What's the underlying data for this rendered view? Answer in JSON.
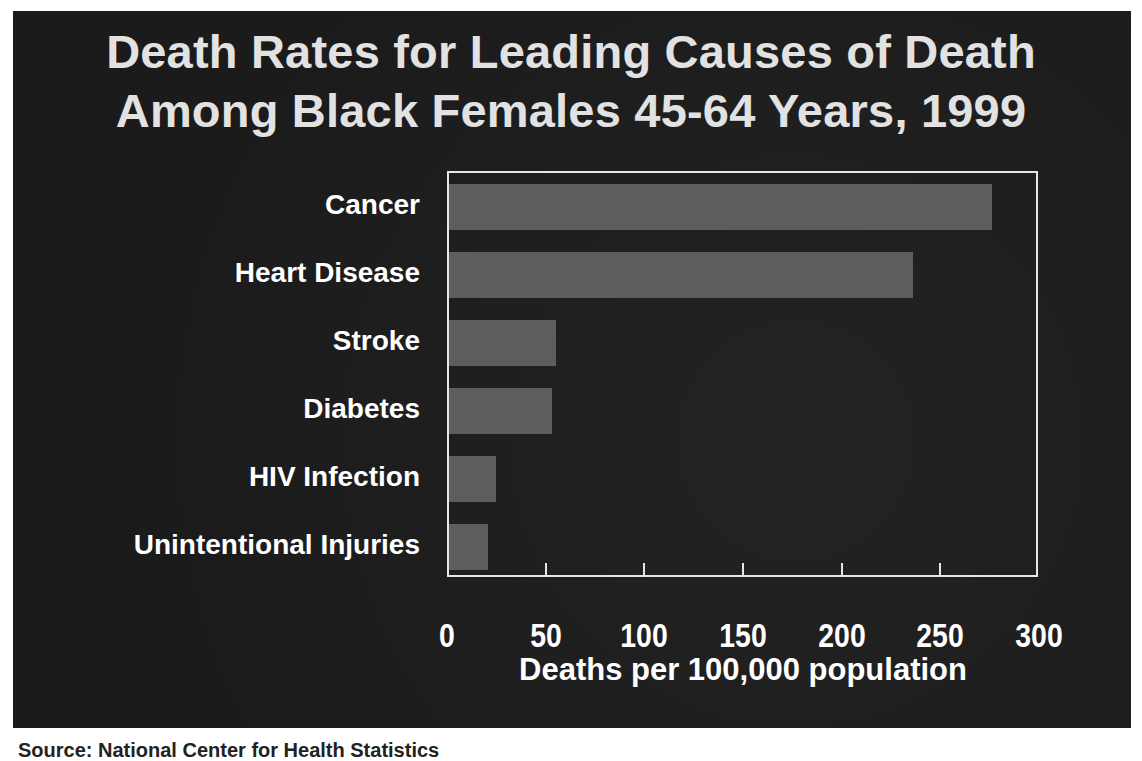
{
  "title": {
    "line1": "Death Rates for Leading Causes of Death",
    "line2": "Among Black Females 45-64 Years, 1999"
  },
  "xaxis": {
    "title": "Deaths per 100,000 population",
    "ticks": [
      "0",
      "50",
      "100",
      "150",
      "200",
      "250",
      "300"
    ]
  },
  "source_partial": "Source: National Center for Health Statistics",
  "colors": {
    "background": "#1d1d1d",
    "bar": "#5d5d5d",
    "text": "#ffffff",
    "axis": "#e6e6e6"
  },
  "chart_data": {
    "type": "bar",
    "orientation": "horizontal",
    "title": "Death Rates for Leading Causes of Death Among Black Females 45-64 Years, 1999",
    "categories": [
      "Cancer",
      "Heart Disease",
      "Stroke",
      "Diabetes",
      "HIV Infection",
      "Unintentional Injuries"
    ],
    "values": [
      276,
      236,
      55,
      53,
      25,
      21
    ],
    "xlabel": "Deaths per 100,000 population",
    "ylabel": "",
    "xlim": [
      0,
      300
    ],
    "xticks": [
      0,
      50,
      100,
      150,
      200,
      250,
      300
    ],
    "grid": false,
    "legend": null
  }
}
